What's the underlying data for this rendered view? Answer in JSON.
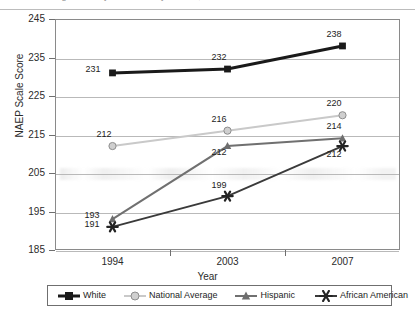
{
  "title": "……… reading scores by race/ethnicity ……… , for Grade 4 …………",
  "chart_data": {
    "type": "line",
    "title": "",
    "xlabel": "Year",
    "ylabel": "NAEP Scale Score",
    "categories": [
      "1994",
      "2003",
      "2007"
    ],
    "x": [
      1994,
      2003,
      2007
    ],
    "ylim": [
      185,
      245
    ],
    "yticks": [
      245,
      235,
      225,
      215,
      205,
      195,
      185
    ],
    "grid": true,
    "legend_position": "bottom",
    "series": [
      {
        "name": "White",
        "values": [
          231,
          232,
          238
        ],
        "color": "#1a1a1a",
        "marker": "square",
        "marker_fill": "#1a1a1a",
        "line_width": 3
      },
      {
        "name": "National Average",
        "values": [
          212,
          216,
          220
        ],
        "color": "#c9c9c9",
        "marker": "circle",
        "marker_fill": "#cfcfcf",
        "line_width": 2
      },
      {
        "name": "Hispanic",
        "values": [
          193,
          212,
          214
        ],
        "color": "#707070",
        "marker": "triangle",
        "marker_fill": "#6e6e6e",
        "line_width": 2
      },
      {
        "name": "African American",
        "values": [
          191,
          199,
          212
        ],
        "color": "#3a3a3a",
        "marker": "asterisk",
        "marker_fill": "#242424",
        "line_width": 2
      }
    ],
    "point_labels": [
      {
        "series": "White",
        "x": "1994",
        "value": "231",
        "dx": -19,
        "dy": -5
      },
      {
        "series": "White",
        "x": "2003",
        "value": "232",
        "dx": -8,
        "dy": -13
      },
      {
        "series": "White",
        "x": "2007",
        "value": "238",
        "dx": -8,
        "dy": -13
      },
      {
        "series": "National Average",
        "x": "1994",
        "value": "212",
        "dx": -8,
        "dy": -13
      },
      {
        "series": "National Average",
        "x": "2003",
        "value": "216",
        "dx": -8,
        "dy": -13
      },
      {
        "series": "National Average",
        "x": "2007",
        "value": "220",
        "dx": -8,
        "dy": -13
      },
      {
        "series": "Hispanic",
        "x": "1994",
        "value": "193",
        "dx": -20,
        "dy": -5
      },
      {
        "series": "Hispanic",
        "x": "2003",
        "value": "212",
        "dx": -8,
        "dy": 5
      },
      {
        "series": "Hispanic",
        "x": "2007",
        "value": "214",
        "dx": -8,
        "dy": -13
      },
      {
        "series": "African American",
        "x": "1994",
        "value": "191",
        "dx": -20,
        "dy": -4
      },
      {
        "series": "African American",
        "x": "2003",
        "value": "199",
        "dx": -8,
        "dy": -12
      },
      {
        "series": "African American",
        "x": "2007",
        "value": "212",
        "dx": -8,
        "dy": 7
      }
    ]
  }
}
